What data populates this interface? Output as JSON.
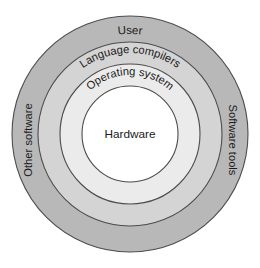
{
  "diagram": {
    "type": "concentric-layers",
    "title": "",
    "background_color": "#ffffff",
    "center": {
      "x": 130,
      "y": 134
    },
    "layers": [
      {
        "id": "outer",
        "label": "User",
        "secondary_labels": [
          "Other software",
          "Software tools"
        ],
        "fill": "#b8b8b8",
        "stroke": "#4d4d4d",
        "outer_radius": 118,
        "inner_radius": 92
      },
      {
        "id": "compilers",
        "label": "Language compilers",
        "secondary_labels": [],
        "fill": "#d4d4d4",
        "stroke": "#4d4d4d",
        "outer_radius": 92,
        "inner_radius": 70
      },
      {
        "id": "os",
        "label": "Operating system",
        "secondary_labels": [],
        "fill": "#ebebeb",
        "stroke": "#4d4d4d",
        "outer_radius": 70,
        "inner_radius": 48
      },
      {
        "id": "core",
        "label": "Hardware",
        "secondary_labels": [],
        "fill": "#ffffff",
        "stroke": "#4d4d4d",
        "outer_radius": 48,
        "inner_radius": 0
      }
    ],
    "labels": {
      "user": "User",
      "language_compilers": "Language compilers",
      "operating_system": "Operating system",
      "hardware": "Hardware",
      "other_software": "Other software",
      "software_tools": "Software tools"
    },
    "text_color": "#1a1a1a"
  }
}
